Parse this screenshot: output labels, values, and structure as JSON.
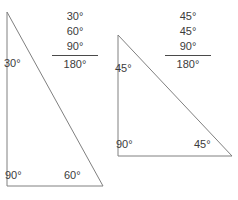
{
  "figure": {
    "stroke_color": "#808080",
    "text_color": "#3b3b3b",
    "background": "#ffffff"
  },
  "triangles": [
    {
      "name": "thirty-sixty-ninety-triangle",
      "interior_angles": {
        "top_left": "30°",
        "bottom_left": "90°",
        "bottom_right": "60°"
      },
      "sum_column": {
        "addend_1": "30°",
        "addend_2": "60°",
        "addend_3": "90°",
        "total": "180°"
      }
    },
    {
      "name": "forty-five-forty-five-ninety-triangle",
      "interior_angles": {
        "top_left": "45°",
        "bottom_left": "90°",
        "bottom_right": "45°"
      },
      "sum_column": {
        "addend_1": "45°",
        "addend_2": "45°",
        "addend_3": "90°",
        "total": "180°"
      }
    }
  ]
}
